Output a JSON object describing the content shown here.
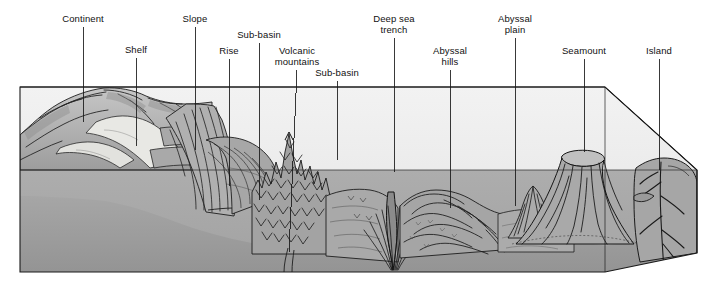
{
  "figure": {
    "type": "block-diagram",
    "style": "grayscale pen-and-ink illustration",
    "colors": {
      "background": "#ffffff",
      "water_volume": "#ececec",
      "crust_block": "#a8a8a8",
      "seafloor": "#9a9a9a",
      "land": "#b4b4b4",
      "line": "#1a1a1a",
      "label_text": "#111111"
    }
  },
  "labels": [
    {
      "id": "continent",
      "text": "Continent",
      "lines": [
        "Continent"
      ],
      "cx": 83,
      "text_top": 13,
      "leader_from_y": 27,
      "leader_to_x": 83,
      "leader_to_y": 122
    },
    {
      "id": "shelf",
      "text": "Shelf",
      "lines": [
        "Shelf"
      ],
      "cx": 136,
      "text_top": 44,
      "leader_from_y": 58,
      "leader_to_x": 136,
      "leader_to_y": 146
    },
    {
      "id": "slope",
      "text": "Slope",
      "lines": [
        "Slope"
      ],
      "cx": 195,
      "text_top": 13,
      "leader_from_y": 27,
      "leader_to_x": 195,
      "leader_to_y": 150
    },
    {
      "id": "rise",
      "text": "Rise",
      "lines": [
        "Rise"
      ],
      "cx": 229,
      "text_top": 45,
      "leader_from_y": 59,
      "leader_to_x": 229,
      "leader_to_y": 186
    },
    {
      "id": "sub-basin-1",
      "text": "Sub-basin",
      "lines": [
        "Sub-basin"
      ],
      "cx": 259,
      "text_top": 29,
      "leader_from_y": 43,
      "leader_to_x": 259,
      "leader_to_y": 200
    },
    {
      "id": "volcanic-mountains",
      "text": "Volcanic mountains",
      "lines": [
        "Volcanic",
        "mountains"
      ],
      "cx": 297,
      "text_top": 45,
      "leader_from_y": 70,
      "leader_to_x": 289,
      "leader_to_y": 252
    },
    {
      "id": "sub-basin-2",
      "text": "Sub-basin",
      "lines": [
        "Sub-basin"
      ],
      "cx": 337,
      "text_top": 67,
      "leader_from_y": 81,
      "leader_to_x": 337,
      "leader_to_y": 160
    },
    {
      "id": "deep-sea-trench",
      "text": "Deep sea trench",
      "lines": [
        "Deep sea",
        "trench"
      ],
      "cx": 394,
      "text_top": 13,
      "leader_from_y": 38,
      "leader_to_x": 394,
      "leader_to_y": 172
    },
    {
      "id": "abyssal-hills",
      "text": "Abyssal hills",
      "lines": [
        "Abyssal",
        "hills"
      ],
      "cx": 450,
      "text_top": 45,
      "leader_from_y": 70,
      "leader_to_x": 450,
      "leader_to_y": 208
    },
    {
      "id": "abyssal-plain",
      "text": "Abyssal plain",
      "lines": [
        "Abyssal",
        "plain"
      ],
      "cx": 515,
      "text_top": 13,
      "leader_from_y": 38,
      "leader_to_x": 515,
      "leader_to_y": 206
    },
    {
      "id": "seamount",
      "text": "Seamount",
      "lines": [
        "Seamount"
      ],
      "cx": 584,
      "text_top": 45,
      "leader_from_y": 59,
      "leader_to_x": 584,
      "leader_to_y": 152
    },
    {
      "id": "island",
      "text": "Island",
      "lines": [
        "Island"
      ],
      "cx": 659,
      "text_top": 45,
      "leader_from_y": 59,
      "leader_to_x": 659,
      "leader_to_y": 170
    }
  ],
  "geometry": {
    "block": {
      "front_left_x": 20,
      "front_bottom_y": 272,
      "front_right_x": 697,
      "front_right_y": 170,
      "back_top_y": 87,
      "back_right_x": 605
    },
    "waterline_y": 170
  }
}
